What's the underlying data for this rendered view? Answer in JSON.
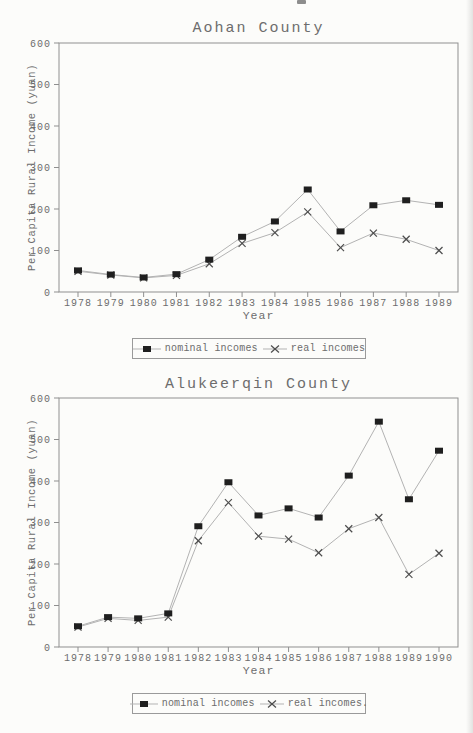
{
  "page": {
    "background": "#fcfcfa",
    "ink_color": "#6d6d6d",
    "nominal_marker_color": "#1f1f1f",
    "real_marker_color": "#4d4d4d",
    "line_color": "#b3b3b3"
  },
  "chart_data": [
    {
      "type": "line",
      "title": "Aohan County",
      "xlabel": "Year",
      "ylabel": "Per Capita Rural Income (yuan)",
      "ylim": [
        0,
        600
      ],
      "yticks": [
        0,
        100,
        200,
        300,
        400,
        500,
        600
      ],
      "grid": false,
      "legend_position": "bottom",
      "categories": [
        "1978",
        "1979",
        "1980",
        "1981",
        "1982",
        "1983",
        "1984",
        "1985",
        "1986",
        "1987",
        "1988",
        "1989"
      ],
      "series": [
        {
          "name": "nominal incomes",
          "marker": "square",
          "values": [
            52,
            42,
            35,
            43,
            78,
            133,
            170,
            247,
            146,
            209,
            221,
            210
          ]
        },
        {
          "name": "real incomes",
          "marker": "x",
          "values": [
            50,
            41,
            34,
            40,
            68,
            117,
            143,
            193,
            107,
            142,
            127,
            100
          ]
        }
      ]
    },
    {
      "type": "line",
      "title": "Alukeerqin County",
      "xlabel": "Year",
      "ylabel": "Per Capita Rural Income (yuan)",
      "ylim": [
        0,
        600
      ],
      "yticks": [
        0,
        100,
        200,
        300,
        400,
        500,
        600
      ],
      "grid": false,
      "legend_position": "bottom",
      "categories": [
        "1978",
        "1979",
        "1980",
        "1981",
        "1982",
        "1983",
        "1984",
        "1985",
        "1986",
        "1987",
        "1988",
        "1989",
        "1990"
      ],
      "series": [
        {
          "name": "nominal incomes",
          "marker": "square",
          "values": [
            50,
            72,
            69,
            81,
            291,
            397,
            317,
            334,
            312,
            413,
            543,
            356,
            473
          ]
        },
        {
          "name": "real incomes.",
          "marker": "x",
          "values": [
            48,
            69,
            64,
            72,
            256,
            348,
            267,
            260,
            227,
            285,
            312,
            175,
            226
          ]
        }
      ]
    }
  ]
}
